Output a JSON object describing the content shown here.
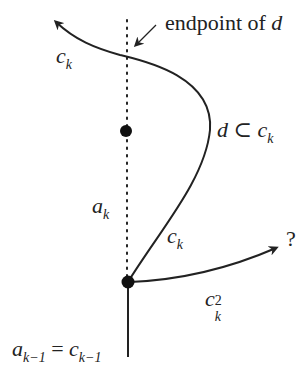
{
  "diagram": {
    "labels": {
      "endpoint": "endpoint of ",
      "endpoint_var": "d",
      "ck_top": "c",
      "ck_top_sub": "k",
      "d_sub": "d",
      "subset": " ⊂ ",
      "d_c": "c",
      "d_c_sub": "k",
      "ak": "a",
      "ak_sub": "k",
      "ck_mid": "c",
      "ck_mid_sub": "k",
      "question": "?",
      "ck2": "c",
      "ck2_sub": "k",
      "ck2_sup": "2",
      "bottom_a": "a",
      "bottom_a_sub": "k−1",
      "bottom_eq": " = ",
      "bottom_c": "c",
      "bottom_c_sub": "k−1"
    },
    "colors": {
      "stroke": "#222222",
      "background": "#ffffff"
    }
  }
}
